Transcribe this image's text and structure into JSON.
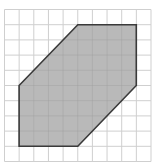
{
  "diagram": {
    "type": "grid-polygon",
    "grid": {
      "cols": 10,
      "rows": 10,
      "origin_px": [
        4.5,
        9.5
      ],
      "cell_w": 14.65,
      "cell_h": 15.2,
      "line_color": "#cfcfcf"
    },
    "polygon": {
      "shape": "hexagon",
      "vertices_grid": [
        [
          5,
          1
        ],
        [
          9,
          1
        ],
        [
          9,
          5
        ],
        [
          5,
          9
        ],
        [
          1,
          9
        ],
        [
          1,
          5
        ]
      ],
      "fill": "#b9b9b9",
      "stroke": "#3a3a3a",
      "stroke_width": 1.6
    }
  }
}
